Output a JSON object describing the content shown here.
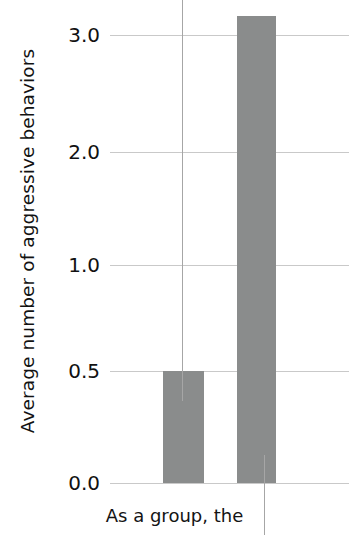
{
  "chart_data": {
    "type": "bar",
    "title": "",
    "subtitle": "",
    "xlabel": "",
    "ylabel": "Average number of aggressive behaviors",
    "categories": [
      "",
      ""
    ],
    "values": [
      0.5,
      3.2
    ],
    "series": [
      {
        "name": "Average number of aggressive behaviors",
        "values": [
          0.5,
          3.2
        ]
      }
    ],
    "ytick_labels": [
      "3.0",
      "2.0",
      "1.0",
      "0.5",
      "0.0"
    ],
    "ytick_values": [
      3.0,
      2.0,
      1.0,
      0.5,
      0.0
    ],
    "ylim": [
      0.0,
      3.4
    ],
    "grid": true,
    "legend": "none",
    "bar_color": "#8a8c8c",
    "gridline_color": "#c9c9c9",
    "axis_note": "y-axis tick spacing is non-linear (0.0, 0.5, 1.0, 2.0, 3.0)",
    "annotations": [
      {
        "text": "As a group, the",
        "target_bar_index": 0
      },
      {
        "text": "",
        "target_bar_index": 1
      }
    ]
  },
  "axis": {
    "ticks": [
      {
        "label": "3.0",
        "y": 35
      },
      {
        "label": "2.0",
        "y": 152
      },
      {
        "label": "1.0",
        "y": 265
      },
      {
        "label": "0.5",
        "y": 371
      },
      {
        "label": "0.0",
        "y": 483
      }
    ],
    "y_title": "Average number of aggressive behaviors"
  },
  "bars": [
    {
      "name": "bar-1",
      "value": 0.5,
      "left": 163,
      "width": 41,
      "top": 371,
      "height": 112
    },
    {
      "name": "bar-2",
      "value": 3.2,
      "left": 237,
      "width": 39,
      "top": 16,
      "height": 467
    }
  ],
  "leader_lines": [
    {
      "name": "leader-line-1",
      "left": 182,
      "top": 0,
      "height": 401
    },
    {
      "name": "leader-line-2",
      "left": 264,
      "top": 455,
      "height": 80
    }
  ],
  "caption": {
    "text": "As a group, the"
  }
}
